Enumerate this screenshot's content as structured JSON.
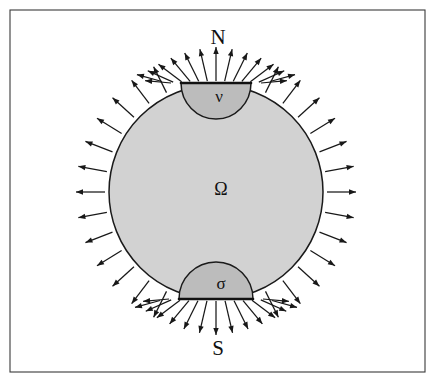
{
  "figure": {
    "background_color": "#ffffff",
    "frame": {
      "stroke_color": "#3a3a3a",
      "x": 10,
      "y": 10,
      "width": 415,
      "height": 362
    }
  },
  "labels": {
    "north_pole": "N",
    "south_pole": "S",
    "interior": "Ω",
    "north_cap": "ν",
    "south_cap": "σ"
  },
  "geometry": {
    "disk": {
      "center_x": 216,
      "center_y": 192,
      "radius": 107,
      "fill_color": "#d2d2d2",
      "stroke_color": "#1a1a1a"
    },
    "north_cap": {
      "center_x": 216,
      "half_width": 35,
      "depth": 36,
      "chord_y": 83,
      "fill_color": "#bcbcbc"
    },
    "south_cap": {
      "center_x": 216,
      "half_width": 37,
      "depth": 37,
      "chord_y": 299,
      "fill_color": "#bcbcbc"
    },
    "label_positions": {
      "north_pole_x": 218,
      "north_pole_y": 39,
      "south_pole_x": 218,
      "south_pole_y": 350,
      "interior_x": 221,
      "interior_y": 191,
      "north_cap_x": 219,
      "north_cap_y": 98,
      "south_cap_x": 221,
      "south_cap_y": 285
    }
  },
  "flux": {
    "description": "Outward-pointing normal flux arrows distributed around the boundary, with dense fans at both poles",
    "arrow_color": "#181818",
    "side_arrow_length": 29,
    "side_arrow_gap": 4,
    "pole_fan_length": 34,
    "pole_fan_gap": 2,
    "side_arrow_count": 34,
    "north_fan_count": 11,
    "south_fan_count": 11
  }
}
